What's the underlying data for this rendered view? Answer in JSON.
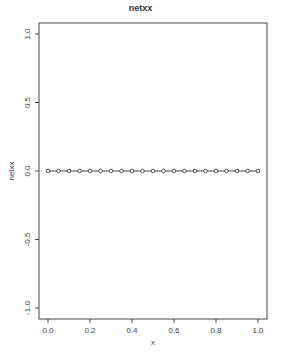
{
  "chart_data": {
    "type": "line",
    "title": "netxx",
    "xlabel": "x",
    "ylabel": "netxx",
    "xlim": [
      0.0,
      1.0
    ],
    "ylim": [
      -1.0,
      1.0
    ],
    "grid": false,
    "legend": null,
    "x_ticks": [
      "0.0",
      "0.2",
      "0.4",
      "0.6",
      "0.8",
      "1.0"
    ],
    "y_ticks": [
      "-1.0",
      "-0.5",
      "0.0",
      "0.5",
      "1.0"
    ],
    "x": [
      0.0,
      0.05,
      0.1,
      0.15,
      0.2,
      0.25,
      0.3,
      0.35,
      0.4,
      0.45,
      0.5,
      0.55,
      0.6,
      0.65,
      0.7,
      0.75,
      0.8,
      0.85,
      0.9,
      0.95,
      1.0
    ],
    "series": [
      {
        "name": "netxx",
        "values": [
          0,
          0,
          0,
          0,
          0,
          0,
          0,
          0,
          0,
          0,
          0,
          0,
          0,
          0,
          0,
          0,
          0,
          0,
          0,
          0,
          0
        ],
        "marker": "circle",
        "line": true
      }
    ]
  }
}
